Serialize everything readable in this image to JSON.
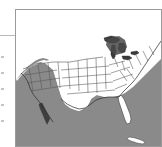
{
  "figure": {
    "name": "united-states-map",
    "frame_color": "#9a9a9a",
    "land_color": "#ffffff",
    "ocean_color": "#8a8a8a",
    "lake_color": "#3a3a3a",
    "border_color": "#2b2b2b",
    "state_line_color": "#555555",
    "caption": "",
    "title": ""
  },
  "map": {
    "region": "Contiguous United States",
    "water_bodies": [
      "Pacific Ocean",
      "Atlantic Ocean",
      "Gulf of Mexico",
      "Great Lakes"
    ],
    "land_masses": [
      "United States",
      "Canada",
      "Mexico",
      "Cuba"
    ],
    "projection_note": "Conic",
    "shows_state_boundaries": "yes"
  },
  "margin": {
    "rule_label": "",
    "fragment_count": 5
  }
}
